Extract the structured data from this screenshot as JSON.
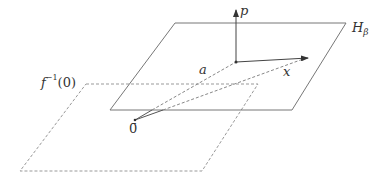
{
  "labels": {
    "p": "p",
    "H_main": "H",
    "H_sub": "β",
    "a": "a",
    "x": "x",
    "f_main": "f",
    "f_sup": "−1",
    "f_arg": "(0)",
    "origin": "0̄"
  },
  "colors": {
    "solid": "#777777",
    "dashed": "#999999",
    "arrow": "#333333",
    "text": "#333333"
  },
  "geometry": {
    "plane_H_beta": [
      [
        175,
        23
      ],
      [
        346,
        23
      ],
      [
        292,
        110
      ],
      [
        110,
        110
      ]
    ],
    "plane_f_inv_0": [
      [
        86,
        84
      ],
      [
        258,
        84
      ],
      [
        202,
        171
      ],
      [
        20,
        171
      ]
    ],
    "origin": [
      135,
      120
    ],
    "base_point": [
      236,
      62
    ],
    "p_tip": [
      236,
      10
    ],
    "x_tip": [
      308,
      58
    ]
  }
}
